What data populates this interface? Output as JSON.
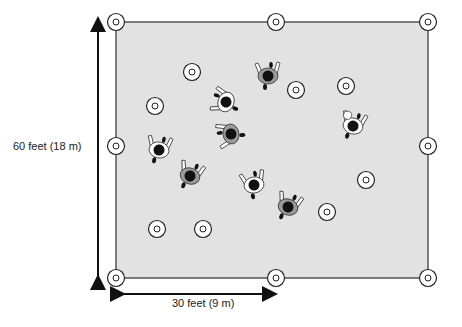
{
  "diagram": {
    "field": {
      "x": 116,
      "y": 22,
      "width": 312,
      "height": 256,
      "fill": "#e2e2e2",
      "stroke": "#555555"
    },
    "labels": {
      "height": "60 feet (18 m)",
      "width": "30 feet (9 m)"
    },
    "arrows": {
      "vertical": {
        "x": 98,
        "y1": 16,
        "y2": 282
      },
      "horizontal": {
        "y": 294,
        "x1": 118,
        "x2": 278
      }
    },
    "cones": [
      {
        "x": 116,
        "y": 22
      },
      {
        "x": 276,
        "y": 22
      },
      {
        "x": 428,
        "y": 22
      },
      {
        "x": 116,
        "y": 146
      },
      {
        "x": 428,
        "y": 146
      },
      {
        "x": 116,
        "y": 278
      },
      {
        "x": 276,
        "y": 278
      },
      {
        "x": 428,
        "y": 278
      },
      {
        "x": 192,
        "y": 72
      },
      {
        "x": 155,
        "y": 106
      },
      {
        "x": 296,
        "y": 90
      },
      {
        "x": 346,
        "y": 86
      },
      {
        "x": 366,
        "y": 180
      },
      {
        "x": 157,
        "y": 229
      },
      {
        "x": 203,
        "y": 229
      },
      {
        "x": 327,
        "y": 212
      }
    ],
    "players": [
      {
        "x": 268,
        "y": 76,
        "shirt": "gray",
        "rot": 0
      },
      {
        "x": 226,
        "y": 102,
        "shirt": "white",
        "rot": -70
      },
      {
        "x": 231,
        "y": 134,
        "shirt": "gray",
        "rot": -100
      },
      {
        "x": 159,
        "y": 150,
        "shirt": "white",
        "rot": 10
      },
      {
        "x": 190,
        "y": 176,
        "shirt": "gray",
        "rot": 20
      },
      {
        "x": 254,
        "y": 185,
        "shirt": "white",
        "rot": -10
      },
      {
        "x": 288,
        "y": 207,
        "shirt": "gray",
        "rot": 20
      },
      {
        "x": 353,
        "y": 126,
        "shirt": "white",
        "rot": 15,
        "ball": true
      }
    ],
    "colors": {
      "gray_shirt": "#9a9a9a",
      "white_shirt": "#ffffff",
      "head": "#111111"
    }
  }
}
